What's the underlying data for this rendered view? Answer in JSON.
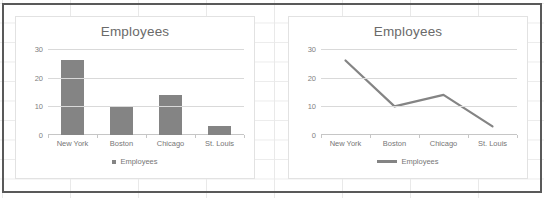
{
  "chart_data": [
    {
      "type": "bar",
      "title": "Employees",
      "categories": [
        "New York",
        "Boston",
        "Chicago",
        "St. Louis"
      ],
      "values": [
        26,
        10,
        14,
        3
      ],
      "series": [
        {
          "name": "Employees",
          "values": [
            26,
            10,
            14,
            3
          ]
        }
      ],
      "xlabel": "",
      "ylabel": "",
      "ylim": [
        0,
        30
      ],
      "yticks": [
        "0",
        "10",
        "20",
        "30"
      ],
      "ytick_values": [
        0,
        10,
        20,
        30
      ],
      "grid": true,
      "legend": {
        "position": "bottom",
        "entries": [
          "Employees"
        ],
        "marker": "square"
      },
      "series_color": "#848484"
    },
    {
      "type": "line",
      "title": "Employees",
      "categories": [
        "New York",
        "Boston",
        "Chicago",
        "St. Louis"
      ],
      "values": [
        26,
        10,
        14,
        3
      ],
      "series": [
        {
          "name": "Employees",
          "values": [
            26,
            10,
            14,
            3
          ]
        }
      ],
      "xlabel": "",
      "ylabel": "",
      "ylim": [
        0,
        30
      ],
      "yticks": [
        "0",
        "10",
        "20",
        "30"
      ],
      "ytick_values": [
        0,
        10,
        20,
        30
      ],
      "grid": true,
      "legend": {
        "position": "bottom",
        "entries": [
          "Employees"
        ],
        "marker": "line"
      },
      "series_color": "#848484"
    }
  ],
  "colors": {
    "series": "#848484",
    "gridline": "#d9d9d9",
    "axis": "#c6c6c6",
    "title_text": "#6a6a6a",
    "label_text": "#767676",
    "panel_border": "#e2e2e2",
    "outer_border": "#595959",
    "sheet_grid": "#e9e9e9",
    "background": "#ffffff"
  }
}
